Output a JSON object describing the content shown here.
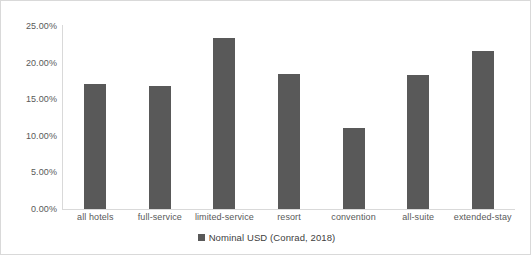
{
  "chart_data": {
    "type": "bar",
    "title": "",
    "xlabel": "",
    "ylabel": "",
    "categories": [
      "all hotels",
      "full-service",
      "limited-service",
      "resort",
      "convention",
      "all-suite",
      "extended-stay"
    ],
    "values": [
      17.1,
      16.8,
      23.4,
      18.4,
      11.1,
      18.3,
      21.6
    ],
    "series": [
      {
        "name": "Nominal USD (Conrad, 2018)",
        "color": "#595959",
        "values": [
          17.1,
          16.8,
          23.4,
          18.4,
          11.1,
          18.3,
          21.6
        ]
      }
    ],
    "ylim": [
      0,
      25
    ],
    "ytick_step": 5,
    "ytick_labels": [
      "0.00%",
      "5.00%",
      "10.00%",
      "15.00%",
      "20.00%",
      "25.00%"
    ],
    "ytick_values": [
      0,
      5,
      10,
      15,
      20,
      25
    ],
    "value_format": "percent",
    "grid": false,
    "legend": {
      "position": "bottom",
      "entries": [
        {
          "label": "Nominal USD (Conrad, 2018)",
          "marker": "square",
          "color": "#595959"
        }
      ]
    }
  },
  "colors": {
    "bar": "#595959",
    "axis": "#d9d9d9",
    "border": "#d9d9d9",
    "text": "#595959",
    "background": "#ffffff"
  }
}
